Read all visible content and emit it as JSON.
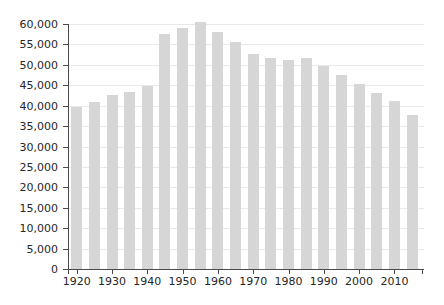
{
  "chart_data": {
    "type": "bar",
    "title": "",
    "xlabel": "",
    "ylabel": "",
    "categories": [
      "1920",
      "1925",
      "1930",
      "1935",
      "1940",
      "1945",
      "1950",
      "1955",
      "1960",
      "1965",
      "1970",
      "1975",
      "1980",
      "1985",
      "1990",
      "1995",
      "2000",
      "2005",
      "2010",
      "2015"
    ],
    "values": [
      39600,
      41000,
      42600,
      43400,
      44700,
      57500,
      59000,
      60500,
      58000,
      55500,
      52700,
      51600,
      51300,
      51600,
      49700,
      47500,
      45200,
      43000,
      41200,
      37700
    ],
    "ylim": [
      0,
      60000
    ],
    "y_tick_step": 5000,
    "y_tick_labels": [
      "0",
      "5,000",
      "10,000",
      "15,000",
      "20,000",
      "25,000",
      "30,000",
      "35,000",
      "40,000",
      "45,000",
      "50,000",
      "55,000",
      "60,000"
    ],
    "x_tick_labels": [
      "1920",
      "1930",
      "1940",
      "1950",
      "1960",
      "1970",
      "1980",
      "1990",
      "2000",
      "2010"
    ],
    "grid": true,
    "legend": false,
    "colors": {
      "bar": "#d6d6d6",
      "grid": "#e9e9e9",
      "axis": "#4a4a4a",
      "text": "#262626",
      "background": "#ffffff"
    }
  }
}
